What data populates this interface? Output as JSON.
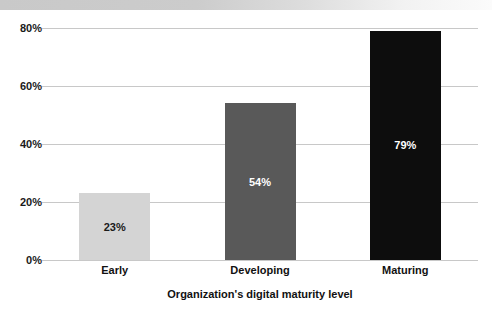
{
  "title_band": {
    "text": "",
    "color": "#cccccc",
    "visible": true
  },
  "chart_data": {
    "type": "bar",
    "title": "",
    "xlabel": "Organization's digital maturity level",
    "ylabel": "",
    "categories": [
      "Early",
      "Developing",
      "Maturing"
    ],
    "values": [
      23,
      54,
      79
    ],
    "labels": [
      "23%",
      "54%",
      "79%"
    ],
    "bar_colors": [
      "#d4d4d4",
      "#595959",
      "#0d0d0d"
    ],
    "label_colors": [
      "#1a1a1a",
      "#ffffff",
      "#ffffff"
    ],
    "ylim": [
      0,
      80
    ],
    "yticks": [
      0,
      20,
      40,
      60,
      80
    ],
    "ytick_labels": [
      "0%",
      "20%",
      "40%",
      "60%",
      "80%"
    ],
    "grid": true,
    "grid_color": "#c8c8c8",
    "legend": "none"
  }
}
